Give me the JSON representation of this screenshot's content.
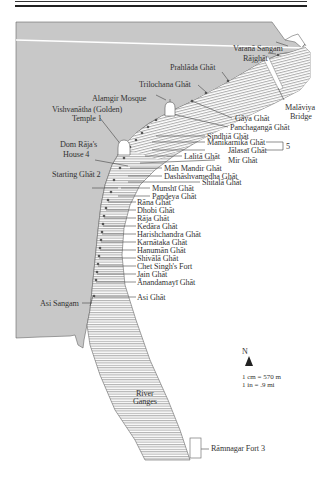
{
  "map": {
    "colors": {
      "land": "#c8c8c8",
      "river": "#ffffff",
      "hatch": "#8a8a8a",
      "ink": "#333333",
      "road": "#ffffff"
    },
    "labels_left": {
      "varana_sangam": "Varanā Sangam",
      "rajghat": "Rājghāt",
      "prahlada": "Prahlāda Ghāt",
      "trilochana": "Trilochana Ghāt",
      "alamgir": "Alamgir Mosque",
      "vishvanatha_1": "Vishvanātha (Golden)",
      "vishvanatha_2": "Temple 1",
      "dom_raja_1": "Dom Rāja's",
      "dom_raja_2": "House 4",
      "starting_ghat": "Starting Ghāt 2",
      "asi_sangam": "Asi Sangam"
    },
    "bridge": {
      "line1": "Malāviya",
      "line2": "Bridge"
    },
    "ghats_right": [
      "Gāya Ghāt",
      "Panchagangā Ghāt",
      "Sindhiā Ghāt",
      "Manikarnikā Ghāt",
      "Jālasaī Ghāt",
      "Lalitā Ghāt",
      "Mir Ghāt",
      "Mān Mandir Ghāt",
      "Dashāshvamedha Ghāt",
      "Shitalā Ghāt",
      "Munshī Ghāt",
      "Pandeya Ghāt",
      "Rāna Ghāt",
      "Dhobi Ghāt",
      "Rāja Ghāt",
      "Kedāra Ghāt",
      "Harishchandra Ghāt",
      "Karnātaka Ghāt",
      "Hanumān Ghāt",
      "Shivālā Ghāt",
      "Chet Singh's Fort",
      "Jain Ghāt",
      "Ānandamayī Ghāt",
      "Asi Ghāt"
    ],
    "bracket_number": "5",
    "river_label_1": "River",
    "river_label_2": "Ganges",
    "ramnagar": "Rāmnagar Fort 3",
    "compass": {
      "north": "N"
    },
    "scale": {
      "line1": "1 cm = 570 m",
      "line2": "1 in = .9 mi"
    }
  }
}
